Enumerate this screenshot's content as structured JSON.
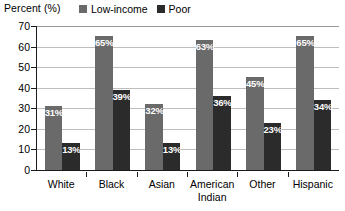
{
  "chart_data": {
    "type": "bar",
    "title": "",
    "subtitle": "",
    "xlabel": "",
    "ylabel": "Percent (%)",
    "ylim": [
      0,
      70
    ],
    "ytick_step": 10,
    "yticks": [
      70,
      60,
      50,
      40,
      30,
      20,
      10,
      0
    ],
    "grid": true,
    "grid_axis": "y",
    "legend_position": "top",
    "value_label_format": "{v}%",
    "categories": [
      "White",
      "Black",
      "Asian",
      "American\nIndian",
      "Other",
      "Hispanic"
    ],
    "series": [
      {
        "name": "Low-income",
        "color": "#6a6a6a",
        "values": [
          31,
          65,
          32,
          63,
          45,
          65
        ],
        "labels": [
          "31%",
          "65%",
          "32%",
          "63%",
          "45%",
          "65%"
        ]
      },
      {
        "name": "Poor",
        "color": "#2b2b2b",
        "values": [
          13,
          39,
          13,
          36,
          23,
          34
        ],
        "labels": [
          "13%",
          "39%",
          "13%",
          "36%",
          "23%",
          "34%"
        ]
      }
    ]
  },
  "axis": {
    "y_title": "Percent (%)",
    "tick_labels": [
      "70",
      "60",
      "50",
      "40",
      "30",
      "20",
      "10",
      "0"
    ]
  },
  "legend": {
    "entries": [
      {
        "label": "Low-income",
        "color": "#6a6a6a"
      },
      {
        "label": "Poor",
        "color": "#2b2b2b"
      }
    ]
  },
  "colors": {
    "low_income": "#6a6a6a",
    "poor": "#2b2b2b",
    "axis": "#1b1b1b",
    "gridline": "#bdbdbd",
    "background": "#ffffff",
    "value_label": "#ffffff"
  }
}
